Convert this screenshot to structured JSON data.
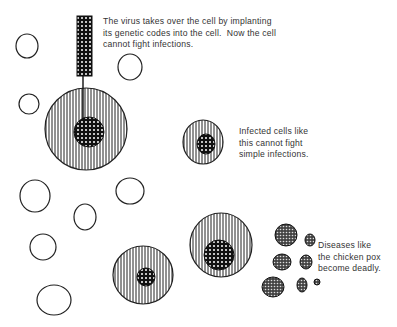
{
  "diagram": {
    "captions": {
      "virus": "The virus takes over the cell by implanting\nits genetic codes into the cell.  Now the cell\ncannot fight infections.",
      "infected": "Infected cells like\nthis cannot fight\nsimple infections.",
      "diseases": "Diseases like\nthe chicken pox\nbecome deadly."
    },
    "colors": {
      "stroke": "#222222",
      "background": "#ffffff"
    }
  }
}
